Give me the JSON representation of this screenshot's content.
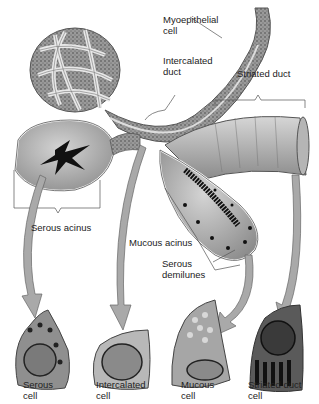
{
  "diagram": {
    "type": "anatomical-illustration",
    "labels": {
      "myoepithelial": [
        "Myoepithelial",
        "cell"
      ],
      "intercalated_duct": [
        "Intercalated",
        "duct"
      ],
      "striated_duct": "Striated duct",
      "serous_acinus": "Serous acinus",
      "mucous_acinus": "Mucous acinus",
      "serous_demilunes": [
        "Serous",
        "demilunes"
      ]
    },
    "cells": [
      {
        "line1": "Serous",
        "line2": "cell"
      },
      {
        "line1": "Intercalated",
        "line2": "cell"
      },
      {
        "line1": "Mucous",
        "line2": "cell"
      },
      {
        "line1": "Striated duct",
        "line2": "cell"
      }
    ],
    "colors": {
      "tissue": "#b8b8b8",
      "tissue_dark": "#6e6e6e",
      "arrow": "#a9a9a9",
      "lumen": "#111111",
      "outline": "#ffffff"
    }
  }
}
